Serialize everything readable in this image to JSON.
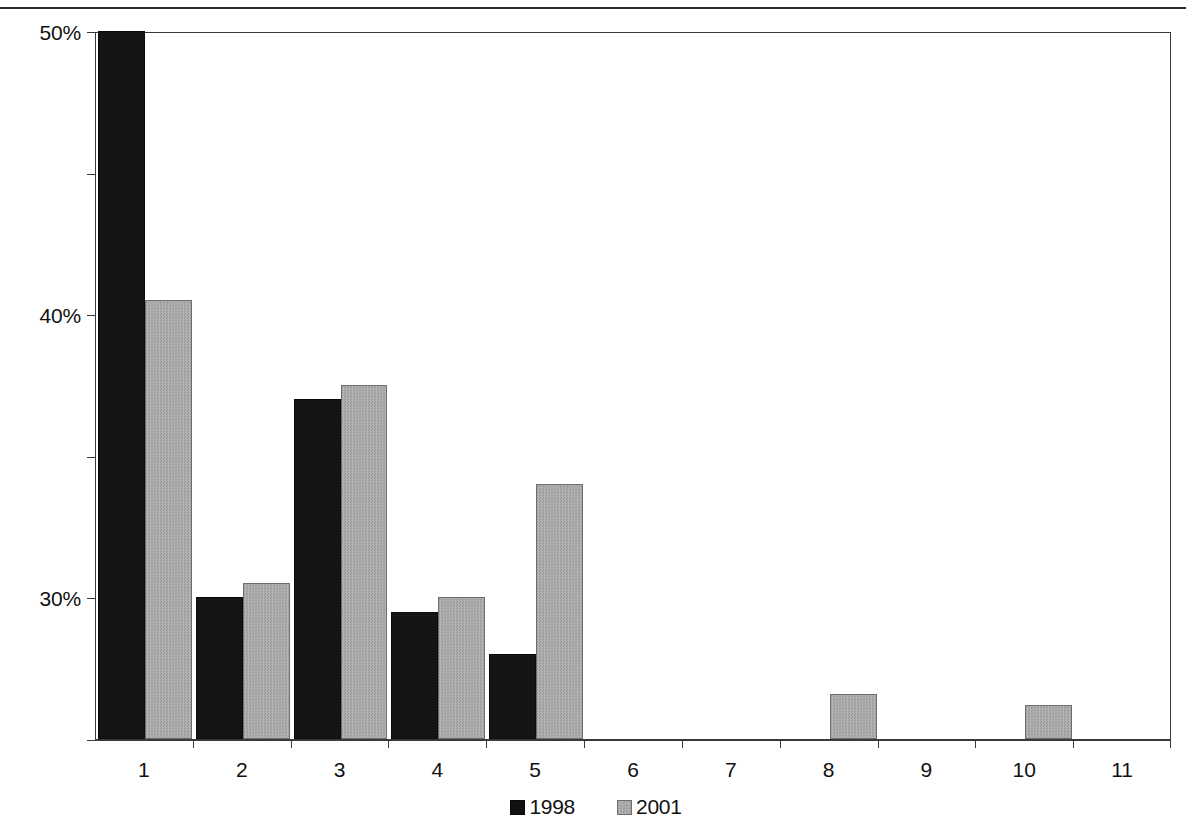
{
  "chart_data": {
    "type": "bar",
    "title": "",
    "subtitle": "",
    "xlabel": "",
    "ylabel": "",
    "categories": [
      "1",
      "2",
      "3",
      "4",
      "5",
      "6",
      "7",
      "8",
      "9",
      "10",
      "11"
    ],
    "series": [
      {
        "name": "1998",
        "color": "#111111",
        "values": [
          50,
          10,
          24,
          9,
          6,
          0,
          0,
          0,
          0,
          0,
          0
        ]
      },
      {
        "name": "2001",
        "color": "#a9a9a9",
        "values": [
          31,
          11,
          25,
          10,
          18,
          0,
          0,
          3.2,
          0,
          2.4,
          0
        ]
      }
    ],
    "ylim": [
      0,
      50
    ],
    "yticks": [
      0,
      10,
      20,
      30,
      40,
      50
    ],
    "ytick_labels": [
      "0%",
      "10%",
      "20%",
      "30%",
      "40%",
      "50%"
    ],
    "grid": false,
    "legend_position": "bottom-center"
  },
  "legend": {
    "items": [
      {
        "label": "1998"
      },
      {
        "label": "2001"
      }
    ]
  },
  "axes": {
    "y_tick_labels": [
      "0%",
      "10%",
      "20%",
      "30%",
      "40%",
      "50%"
    ],
    "x_tick_labels": [
      "1",
      "2",
      "3",
      "4",
      "5",
      "6",
      "7",
      "8",
      "9",
      "10",
      "11"
    ]
  }
}
